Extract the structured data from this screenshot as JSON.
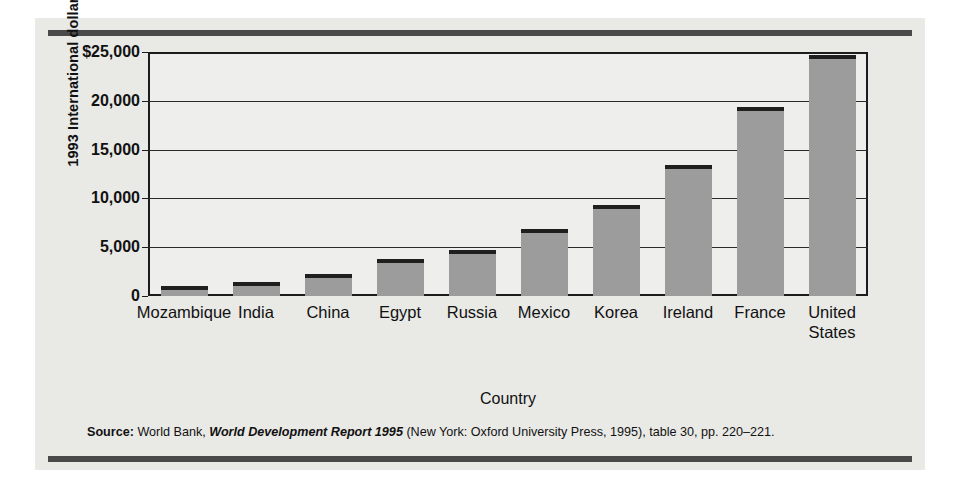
{
  "chart_data": {
    "type": "bar",
    "title": "",
    "xlabel": "Country",
    "ylabel": "1993 International dollars",
    "categories": [
      "Mozambique",
      "India",
      "China",
      "Egypt",
      "Russia",
      "Mexico",
      "Korea",
      "Ireland",
      "France",
      "United States"
    ],
    "category_display": [
      "Mozambique",
      "India",
      "China",
      "Egypt",
      "Russia",
      "Mexico",
      "Korea",
      "Ireland",
      "France",
      "United\nStates"
    ],
    "values": [
      1000,
      1400,
      2300,
      3800,
      4700,
      6900,
      9300,
      13400,
      19400,
      24700
    ],
    "ylim": [
      0,
      25000
    ],
    "yticks": [
      0,
      5000,
      10000,
      15000,
      20000,
      25000
    ],
    "ytick_labels": [
      "0",
      "5,000",
      "10,000",
      "15,000",
      "20,000",
      "$25,000"
    ],
    "grid": true,
    "legend": "none",
    "bar_color": "#9c9c9c",
    "bar_top_color": "#1f1f1f",
    "plot_background": "#eeeeec",
    "figure_background": "#e9e9e6",
    "axis_color": "#1c1c1c"
  },
  "source": {
    "label": "Source:",
    "publisher": "World Bank,",
    "title_italic": "World Development Report 1995",
    "rest": "(New York: Oxford University Press, 1995), table 30, pp. 220–221."
  }
}
